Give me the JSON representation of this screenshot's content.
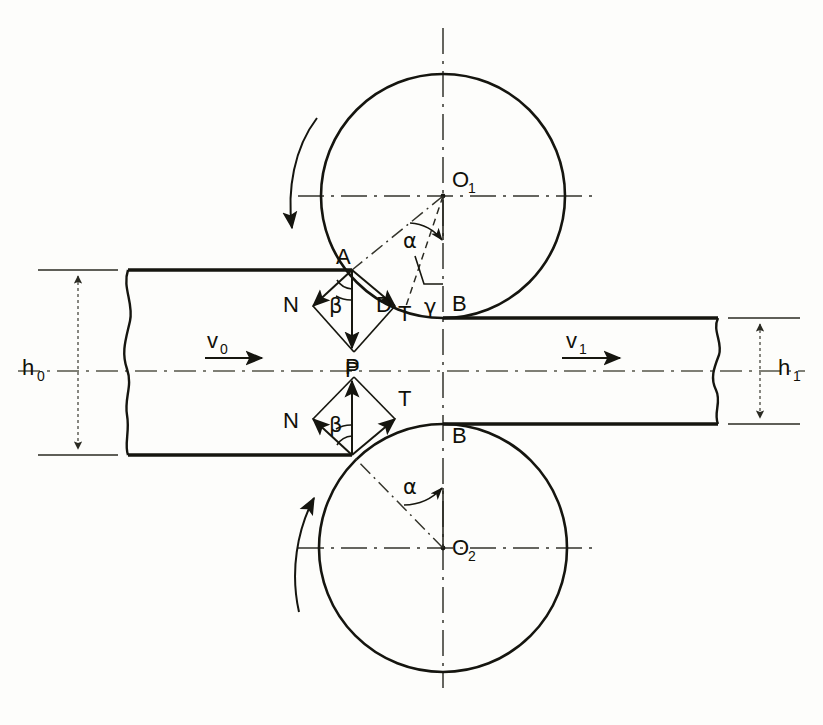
{
  "labels": {
    "upper_roll_center": "O",
    "upper_roll_center_sub": "1",
    "lower_roll_center": "O",
    "lower_roll_center_sub": "2",
    "entry_contact_point": "A",
    "exit_contact_point": "B",
    "neutral_point": "D",
    "normal_force": "N",
    "tangential_force": "T",
    "resultant_force": "P",
    "friction_angle": "β",
    "bite_angle": "α",
    "neutral_angle": "γ",
    "entry_velocity": "v",
    "entry_velocity_sub": "0",
    "exit_velocity": "v",
    "exit_velocity_sub": "1",
    "entry_thickness": "h",
    "entry_thickness_sub": "0",
    "exit_thickness": "h",
    "exit_thickness_sub": "1",
    "lower_normal_force": "N",
    "lower_tangential_force": "T",
    "lower_resultant_force": "P",
    "lower_friction_angle": "β",
    "lower_bite_angle": "α",
    "lower_exit_contact_point": "B"
  },
  "geometry": {
    "upper_roll": {
      "cx": 443,
      "cy": 196,
      "r": 122
    },
    "lower_roll": {
      "cx": 443,
      "cy": 548,
      "r": 124
    },
    "entry_contact": {
      "x": 352,
      "y": 270
    },
    "exit_contact_upper": {
      "x": 443,
      "y": 318
    },
    "exit_contact_lower": {
      "x": 443,
      "y": 424
    },
    "entry_contact_lower": {
      "x": 352,
      "y": 455
    },
    "slab_top_y": 270,
    "slab_bottom_y": 455,
    "strip_top_y": 318,
    "strip_bottom_y": 424,
    "slab_left_x": 128,
    "strip_right_x": 718,
    "centre_axis_y": 371,
    "vertical_axis_x": 443
  },
  "colors": {
    "ink": "#15150f",
    "paper": "#fdfdfb",
    "centre_line": "#33332c"
  },
  "rotation": {
    "upper_direction": "clockwise",
    "lower_direction": "counter-clockwise"
  }
}
